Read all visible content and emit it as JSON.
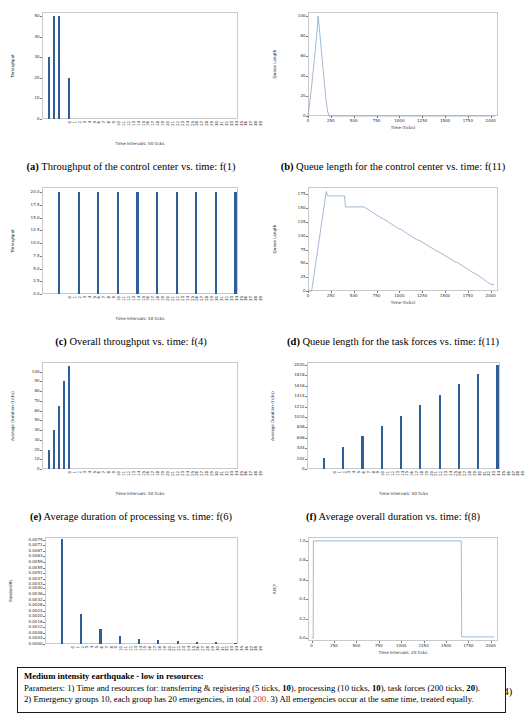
{
  "figures": [
    {
      "key": "a",
      "caption_label": "(a)",
      "caption_text": "Throughput of the control center vs. time: f(1)",
      "chart_data": {
        "type": "bar",
        "title": "Throughput of the control center vs. time: f(1)",
        "xlabel": "Time Intervals: 50 ticks",
        "ylabel": "Throughput",
        "ylim": [
          0,
          52
        ],
        "yticks": [
          0,
          10,
          20,
          30,
          40,
          50
        ],
        "grid": false,
        "categories": [
          "0",
          "1",
          "2",
          "3",
          "4",
          "5",
          "6",
          "7",
          "8",
          "9",
          "10",
          "11",
          "12",
          "13",
          "14",
          "15",
          "16",
          "17",
          "18",
          "19",
          "20",
          "21",
          "22",
          "23",
          "24",
          "25",
          "26",
          "27",
          "28",
          "29",
          "30",
          "31",
          "32",
          "33",
          "34",
          "35",
          "36",
          "37",
          "38",
          "39"
        ],
        "values": [
          0,
          30,
          50,
          50,
          0,
          20,
          0,
          0,
          0,
          0,
          0,
          0,
          0,
          0,
          0,
          0,
          0,
          0,
          0,
          0,
          0,
          0,
          0,
          0,
          0,
          0,
          0,
          0,
          0,
          0,
          0,
          0,
          0,
          0,
          0,
          0,
          0,
          0,
          0,
          0
        ]
      }
    },
    {
      "key": "b",
      "caption_label": "(b)",
      "caption_text": "Queue length for the control center vs. time: f(11)",
      "chart_data": {
        "type": "line",
        "title": "Queue length for the control center vs. time: f(11)",
        "xlabel": "Time (ticks)",
        "ylabel": "Queue Length",
        "xlim": [
          0,
          2080
        ],
        "ylim": [
          0,
          104
        ],
        "xticks": [
          0,
          250,
          500,
          750,
          1000,
          1250,
          1500,
          1750,
          2000
        ],
        "yticks": [
          0,
          20,
          40,
          60,
          80,
          100
        ],
        "grid": false,
        "x": [
          0,
          20,
          40,
          60,
          80,
          100,
          110,
          120,
          140,
          160,
          180,
          200,
          215,
          230,
          250,
          500,
          1000,
          1500,
          2000,
          2050
        ],
        "y": [
          0,
          14,
          30,
          48,
          66,
          86,
          100,
          92,
          72,
          52,
          32,
          14,
          5,
          0,
          0,
          0,
          0,
          0,
          0,
          0
        ]
      }
    },
    {
      "key": "c",
      "caption_label": "(c)",
      "caption_text": "Overall throughput vs. time: f(4)",
      "chart_data": {
        "type": "bar",
        "title": "Overall throughput vs. time: f(4)",
        "xlabel": "Time Intervals: 50 ticks",
        "ylabel": "Throughput",
        "ylim": [
          0,
          21
        ],
        "yticks": [
          0.0,
          2.5,
          5.0,
          7.5,
          10.0,
          12.5,
          15.0,
          17.5,
          20.0
        ],
        "ytick_labels": [
          "0.0",
          "2.5",
          "5.0",
          "7.5",
          "10.0",
          "12.5",
          "15.0",
          "17.5",
          "20.0"
        ],
        "grid": false,
        "categories": [
          "0",
          "1",
          "2",
          "3",
          "4",
          "5",
          "6",
          "7",
          "8",
          "9",
          "10",
          "11",
          "12",
          "13",
          "14",
          "15",
          "16",
          "17",
          "18",
          "19",
          "20",
          "21",
          "22",
          "23",
          "24",
          "25",
          "26",
          "27",
          "28",
          "29",
          "30",
          "31",
          "32",
          "33",
          "34",
          "35",
          "36",
          "37",
          "38",
          "39"
        ],
        "values": [
          0,
          0,
          0,
          20,
          0,
          0,
          0,
          20,
          0,
          0,
          0,
          20,
          0,
          0,
          0,
          20,
          0,
          0,
          0,
          20,
          0,
          0,
          0,
          20,
          0,
          0,
          0,
          20,
          0,
          0,
          0,
          20,
          0,
          0,
          0,
          20,
          0,
          0,
          0,
          20
        ]
      }
    },
    {
      "key": "d",
      "caption_label": "(d)",
      "caption_text": "Queue length for the task forces vs. time: f(11)",
      "chart_data": {
        "type": "line",
        "title": "Queue length for the task forces vs. time: f(11)",
        "xlabel": "Time (ticks)",
        "ylabel": "Queue Length",
        "xlim": [
          0,
          2080
        ],
        "ylim": [
          0,
          188
        ],
        "xticks": [
          0,
          250,
          500,
          750,
          1000,
          1250,
          1500,
          1750,
          2000
        ],
        "yticks": [
          0,
          25,
          50,
          75,
          100,
          125,
          150,
          175
        ],
        "grid": false,
        "x": [
          0,
          40,
          200,
          215,
          230,
          400,
          410,
          600,
          615,
          800,
          810,
          1000,
          1010,
          1200,
          1215,
          1410,
          1420,
          1620,
          1630,
          1820,
          1830,
          2000,
          2040
        ],
        "y": [
          0,
          0,
          180,
          172,
          172,
          172,
          152,
          152,
          152,
          132,
          132,
          112,
          112,
          92,
          92,
          72,
          72,
          52,
          52,
          32,
          32,
          12,
          12
        ]
      }
    },
    {
      "key": "e",
      "caption_label": "(e)",
      "caption_text": "Average duration of processing vs. time: f(6)",
      "chart_data": {
        "type": "bar",
        "title": "Average duration of processing vs. time: f(6)",
        "xlabel": "Time Intervals: 50 ticks",
        "ylabel": "Average Duration (ticks)",
        "ylim": [
          0,
          110
        ],
        "yticks": [
          0,
          10,
          20,
          30,
          40,
          50,
          60,
          70,
          80,
          90,
          100
        ],
        "grid": false,
        "categories": [
          "0",
          "1",
          "2",
          "3",
          "4",
          "5",
          "6",
          "7",
          "8",
          "9",
          "10",
          "11",
          "12",
          "13",
          "14",
          "15",
          "16",
          "17",
          "18",
          "19",
          "20",
          "21",
          "22",
          "23",
          "24",
          "25",
          "26",
          "27",
          "28",
          "29",
          "30",
          "31",
          "32",
          "33",
          "34",
          "35",
          "36",
          "37",
          "38",
          "39"
        ],
        "values": [
          0,
          20,
          40,
          65,
          90,
          106,
          0,
          0,
          0,
          0,
          0,
          0,
          0,
          0,
          0,
          0,
          0,
          0,
          0,
          0,
          0,
          0,
          0,
          0,
          0,
          0,
          0,
          0,
          0,
          0,
          0,
          0,
          0,
          0,
          0,
          0,
          0,
          0,
          0,
          0
        ]
      }
    },
    {
      "key": "f",
      "caption_label": "(f)",
      "caption_text": "Average overall duration vs. time: f(8)",
      "chart_data": {
        "type": "bar",
        "title": "Average overall duration vs. time: f(8)",
        "xlabel": "Time Intervals: 50 ticks",
        "ylabel": "Average Duration (ticks)",
        "ylim": [
          0,
          2080
        ],
        "yticks": [
          0,
          202,
          404,
          606,
          808,
          1010,
          1212,
          1414,
          1616,
          1818,
          2020
        ],
        "grid": false,
        "categories": [
          "0",
          "1",
          "2",
          "3",
          "4",
          "5",
          "6",
          "7",
          "8",
          "9",
          "10",
          "11",
          "12",
          "13",
          "14",
          "15",
          "16",
          "17",
          "18",
          "19",
          "20",
          "21",
          "22",
          "23",
          "24",
          "25",
          "26",
          "27",
          "28",
          "29",
          "30",
          "31",
          "32",
          "33",
          "34",
          "35",
          "36",
          "37",
          "38",
          "39"
        ],
        "values": [
          0,
          0,
          0,
          212,
          0,
          0,
          0,
          432,
          0,
          0,
          0,
          636,
          0,
          0,
          0,
          838,
          0,
          0,
          0,
          1040,
          0,
          0,
          0,
          1242,
          0,
          0,
          0,
          1444,
          0,
          0,
          0,
          1646,
          0,
          0,
          0,
          1852,
          0,
          0,
          0,
          2030
        ]
      }
    },
    {
      "key": "g",
      "caption_label": "(g)",
      "caption_text": "Agility factor of control center vs. time: f(10)",
      "chart_data": {
        "type": "bar",
        "title": "Agility factor of control center vs. time: f(10)",
        "xlabel": "Time Intervals: 50 ticks",
        "ylabel": "Bandwidth",
        "ylim": [
          0.0,
          0.0077
        ],
        "yticks": [
          0.0,
          0.0004,
          0.0008,
          0.0012,
          0.0016,
          0.002,
          0.0024,
          0.0028,
          0.0032,
          0.0036,
          0.004,
          0.0043,
          0.0047,
          0.0051,
          0.0055,
          0.0059,
          0.0063,
          0.0067,
          0.0071,
          0.0075
        ],
        "ytick_labels": [
          "0.0000",
          "0.0004",
          "0.0008",
          "0.0012",
          "0.0016",
          "0.0020",
          "0.0024",
          "0.0028",
          "0.0032",
          "0.0036",
          "0.0040",
          "0.0043",
          "0.0047",
          "0.0051",
          "0.0055",
          "0.0059",
          "0.0063",
          "0.0067",
          "0.0071",
          "0.0075"
        ],
        "grid": false,
        "categories": [
          "0",
          "1",
          "2",
          "3",
          "4",
          "5",
          "6",
          "7",
          "8",
          "9",
          "10",
          "11",
          "12",
          "13",
          "14",
          "15",
          "16",
          "17",
          "18",
          "19",
          "20",
          "21",
          "22",
          "23",
          "24",
          "25",
          "26",
          "27",
          "28",
          "29",
          "30",
          "31",
          "32",
          "33",
          "34",
          "35",
          "36",
          "37",
          "38",
          "39"
        ],
        "values": [
          0,
          0,
          0,
          0.00755,
          0,
          0,
          0,
          0.00215,
          0,
          0,
          0,
          0.00105,
          0,
          0,
          0,
          0.00055,
          0,
          0,
          0,
          0.00035,
          0,
          0,
          0,
          0.00028,
          0,
          0,
          0,
          0.00022,
          0,
          0,
          0,
          0.00018,
          0,
          0,
          0,
          0.00014,
          0,
          0,
          0,
          0.0001
        ]
      }
    },
    {
      "key": "h",
      "caption_label": "(h)",
      "caption_text": "Relative emergency complexity factor vs. time: f(14)",
      "chart_data": {
        "type": "line",
        "title": "Relative emergency complexity factor vs. time: f(14)",
        "xlabel": "Time Intervals: 20 ticks",
        "ylabel": "RECF",
        "xlim": [
          -40,
          2080
        ],
        "ylim": [
          -0.03,
          1.04
        ],
        "xticks": [
          0,
          250,
          500,
          750,
          1000,
          1250,
          1500,
          1750,
          2000
        ],
        "yticks": [
          0.0,
          0.2,
          0.4,
          0.6,
          0.8,
          1.0
        ],
        "ytick_labels": [
          "0.0",
          "0.2",
          "0.4",
          "0.6",
          "0.8",
          "1.0"
        ],
        "grid": false,
        "x": [
          0,
          18,
          20,
          1660,
          1670,
          1675,
          2000,
          2040
        ],
        "y": [
          0.0,
          0.0,
          1.0,
          1.0,
          1.0,
          0.012,
          0.012,
          0.012
        ]
      }
    }
  ],
  "params_box": {
    "title": "Medium intensity earthquake - low in resources:",
    "line1_pre": "Parameters: 1) Time and resources for: transferring & registering (",
    "line1_t1": "5 ticks",
    "line1_mid1": ", ",
    "line1_v1": "10",
    "line1_mid2": "), processing (10 ticks, ",
    "line1_v2": "10",
    "line1_mid3": "), task forces (200 ticks, ",
    "line1_v3": "20",
    "line1_end": ").",
    "line2_pre": "2) Emergency groups 10, each group has 20 emergencies, in total ",
    "line2_hl": "200",
    "line2_end": ". 3) All emergencies occur at the same time, treated equally."
  }
}
